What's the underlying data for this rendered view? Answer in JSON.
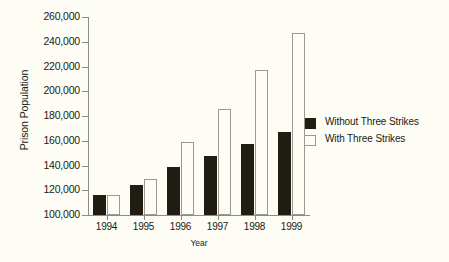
{
  "chart_data": {
    "type": "bar",
    "title": "",
    "xlabel": "Year",
    "ylabel": "Prison Population",
    "categories": [
      "1994",
      "1995",
      "1996",
      "1997",
      "1998",
      "1999"
    ],
    "series": [
      {
        "name": "Without Three Strikes",
        "color": "#221d12",
        "values": [
          116000,
          124000,
          139000,
          148000,
          157000,
          167000
        ]
      },
      {
        "name": "With Three Strikes",
        "color": "#ffffff",
        "values": [
          116000,
          129000,
          159000,
          186000,
          217000,
          247000
        ]
      }
    ],
    "ylim": [
      100000,
      260000
    ],
    "ytick_labels": [
      "260,000",
      "240,000",
      "220,000",
      "200,000",
      "180,000",
      "160,000",
      "140,000",
      "120,000",
      "100,000"
    ],
    "ytick_values": [
      260000,
      240000,
      220000,
      200000,
      180000,
      160000,
      140000,
      120000,
      100000
    ],
    "grid": false,
    "legend_position": "right"
  }
}
